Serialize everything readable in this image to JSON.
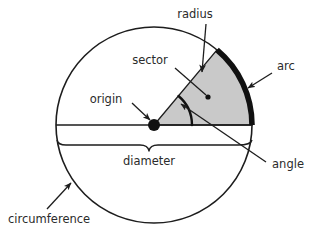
{
  "diagram": {
    "colors": {
      "stroke": "#1d1d1d",
      "sector_fill": "#c9c9c9",
      "arc_highlight": "#111111",
      "text": "#2b2b2b",
      "background": "#ffffff"
    },
    "geometry": {
      "center_x": 154,
      "center_y": 125,
      "radius": 98,
      "sector_start_angle_deg": 0,
      "sector_end_angle_deg": 50,
      "origin_dot_radius": 6,
      "sector_center_dot_radius": 2.6
    },
    "labels": {
      "radius": "radius",
      "sector": "sector",
      "arc": "arc",
      "origin": "origin",
      "angle": "angle",
      "diameter": "diameter",
      "circumference": "circumference"
    }
  }
}
